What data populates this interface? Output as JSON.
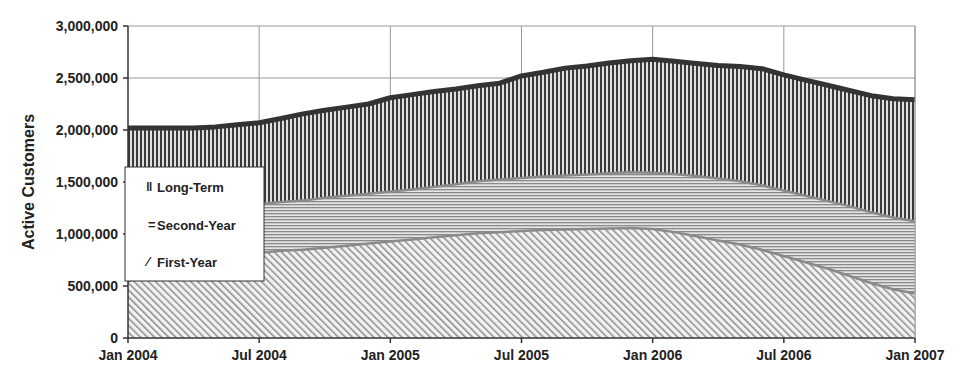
{
  "chart_data": {
    "type": "area",
    "stacked": true,
    "title": "",
    "xlabel": "",
    "ylabel": "Active Customers",
    "ylim": [
      0,
      3000000
    ],
    "yticks": [
      0,
      500000,
      1000000,
      1500000,
      2000000,
      2500000,
      3000000
    ],
    "ytick_labels": [
      "0",
      "500,000",
      "1,000,000",
      "1,500,000",
      "2,000,000",
      "2,500,000",
      "3,000,000"
    ],
    "xtick_labels": [
      "Jan 2004",
      "Jul 2004",
      "Jan 2005",
      "Jul 2005",
      "Jan 2006",
      "Jul 2006",
      "Jan 2007"
    ],
    "grid": true,
    "legend_position": "left-inside",
    "x": [
      "Jan 2004",
      "Feb 2004",
      "Mar 2004",
      "Apr 2004",
      "May 2004",
      "Jun 2004",
      "Jul 2004",
      "Aug 2004",
      "Sep 2004",
      "Oct 2004",
      "Nov 2004",
      "Dec 2004",
      "Jan 2005",
      "Feb 2005",
      "Mar 2005",
      "Apr 2005",
      "May 2005",
      "Jun 2005",
      "Jul 2005",
      "Aug 2005",
      "Sep 2005",
      "Oct 2005",
      "Nov 2005",
      "Dec 2005",
      "Jan 2006",
      "Feb 2006",
      "Mar 2006",
      "Apr 2006",
      "May 2006",
      "Jun 2006",
      "Jul 2006",
      "Aug 2006",
      "Sep 2006",
      "Oct 2006",
      "Nov 2006",
      "Dec 2006",
      "Jan 2007"
    ],
    "series": [
      {
        "name": "First-Year",
        "pattern": "diagonal",
        "values": [
          560000,
          620000,
          680000,
          730000,
          770000,
          800000,
          830000,
          850000,
          860000,
          880000,
          900000,
          920000,
          940000,
          960000,
          980000,
          1000000,
          1020000,
          1030000,
          1040000,
          1050000,
          1055000,
          1060000,
          1065000,
          1070000,
          1060000,
          1030000,
          990000,
          950000,
          910000,
          860000,
          800000,
          740000,
          680000,
          610000,
          540000,
          480000,
          440000
        ]
      },
      {
        "name": "Second-Year",
        "pattern": "horizontal",
        "values": [
          590000,
          560000,
          530000,
          500000,
          480000,
          470000,
          470000,
          470000,
          475000,
          480000,
          480000,
          480000,
          480000,
          480000,
          485000,
          490000,
          500000,
          505000,
          510000,
          515000,
          520000,
          525000,
          530000,
          535000,
          540000,
          560000,
          580000,
          595000,
          610000,
          620000,
          630000,
          640000,
          650000,
          670000,
          680000,
          690000,
          695000
        ]
      },
      {
        "name": "Long-Term",
        "pattern": "vertical",
        "values": [
          870000,
          840000,
          810000,
          790000,
          780000,
          780000,
          770000,
          790000,
          820000,
          830000,
          840000,
          850000,
          890000,
          900000,
          905000,
          905000,
          905000,
          915000,
          970000,
          990000,
          1020000,
          1030000,
          1050000,
          1060000,
          1080000,
          1070000,
          1070000,
          1075000,
          1090000,
          1110000,
          1100000,
          1100000,
          1100000,
          1100000,
          1110000,
          1130000,
          1155000
        ]
      }
    ]
  },
  "legend": {
    "items": [
      {
        "label": "Long-Term",
        "marker": "‖"
      },
      {
        "label": "Second-Year",
        "marker": "="
      },
      {
        "label": "First-Year",
        "marker": "∕"
      }
    ]
  },
  "colors": {
    "long_term_stripe": "#333333",
    "second_year_stripe": "#888888",
    "first_year_stripe": "#888888",
    "top_edge": "#333333",
    "boundary": "#8a8a8a",
    "grid": "#999999",
    "axis": "#333333"
  }
}
